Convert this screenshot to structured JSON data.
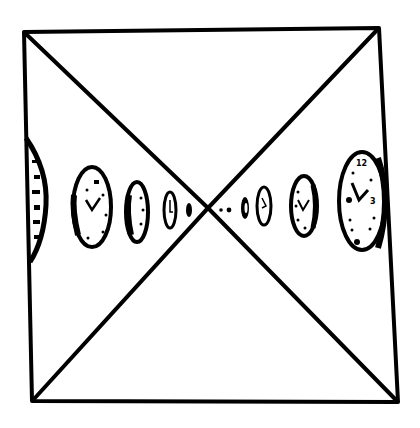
{
  "illustration": {
    "kind": "hand-drawn sketch",
    "description": "Square frame crossed by two diagonals forming an X, with a row of clocks receding in perspective toward the vanishing point at the center.",
    "ink_color": "#000000",
    "paper_color": "#ffffff",
    "frame": {
      "top_left": [
        24,
        32
      ],
      "top_right": [
        379,
        28
      ],
      "bottom_right": [
        398,
        402
      ],
      "bottom_left": [
        32,
        401
      ]
    },
    "vanishing_point": [
      208,
      208
    ],
    "clocks_left": [
      {
        "cx": 30,
        "cy": 200,
        "rx": 16,
        "ry": 60,
        "label": "partially cropped clock"
      },
      {
        "cx": 92,
        "cy": 207,
        "rx": 19,
        "ry": 40,
        "label": "clock"
      },
      {
        "cx": 137,
        "cy": 212,
        "rx": 11,
        "ry": 30,
        "label": "clock"
      },
      {
        "cx": 170,
        "cy": 210,
        "rx": 6,
        "ry": 18,
        "label": "clock"
      },
      {
        "cx": 189,
        "cy": 210,
        "rx": 3,
        "ry": 7,
        "label": "clock"
      }
    ],
    "clocks_right": [
      {
        "cx": 222,
        "cy": 210,
        "rx": 2,
        "ry": 3,
        "label": "clock"
      },
      {
        "cx": 230,
        "cy": 210,
        "rx": 2,
        "ry": 3,
        "label": "clock"
      },
      {
        "cx": 245,
        "cy": 208,
        "rx": 4,
        "ry": 12,
        "label": "clock"
      },
      {
        "cx": 264,
        "cy": 206,
        "rx": 7,
        "ry": 19,
        "label": "clock"
      },
      {
        "cx": 304,
        "cy": 206,
        "rx": 13,
        "ry": 30,
        "label": "clock"
      },
      {
        "cx": 362,
        "cy": 201,
        "rx": 23,
        "ry": 49,
        "label": "clock",
        "numerals": [
          "12",
          "3",
          "9",
          "6"
        ]
      }
    ]
  }
}
